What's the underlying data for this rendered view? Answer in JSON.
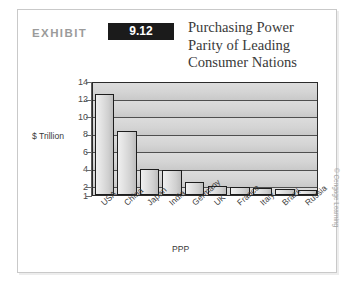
{
  "exhibit": {
    "label": "EXHIBIT",
    "number": "9.12",
    "title": "Purchasing Power\nParity of Leading\nConsumer Nations"
  },
  "credit": {
    "text": "© Cengage Learning"
  },
  "page_artifact": {
    "text": ""
  },
  "chart_data": {
    "type": "bar",
    "title": "Purchasing Power Parity of Leading Consumer Nations",
    "xlabel": "PPP",
    "ylabel": "$ Trillion",
    "categories": [
      "USA",
      "China",
      "Japan",
      "India",
      "Germany",
      "UK",
      "France",
      "Italy",
      "Brazil",
      "Russia"
    ],
    "values": [
      12.5,
      8.3,
      4.0,
      3.8,
      2.5,
      2.0,
      1.9,
      1.8,
      1.7,
      1.6
    ],
    "ytick_labels": [
      "14",
      "12",
      "10",
      "8",
      "6",
      "4",
      "2",
      "1"
    ],
    "ytick_values": [
      14,
      12,
      10,
      8,
      6,
      4,
      2,
      1
    ],
    "ylim": [
      1,
      14
    ],
    "grid": true,
    "legend": false,
    "bar_fill": "#e0e0e0",
    "bar_edge": "#1d1d1d",
    "plot_background": "#d4d4d4"
  }
}
